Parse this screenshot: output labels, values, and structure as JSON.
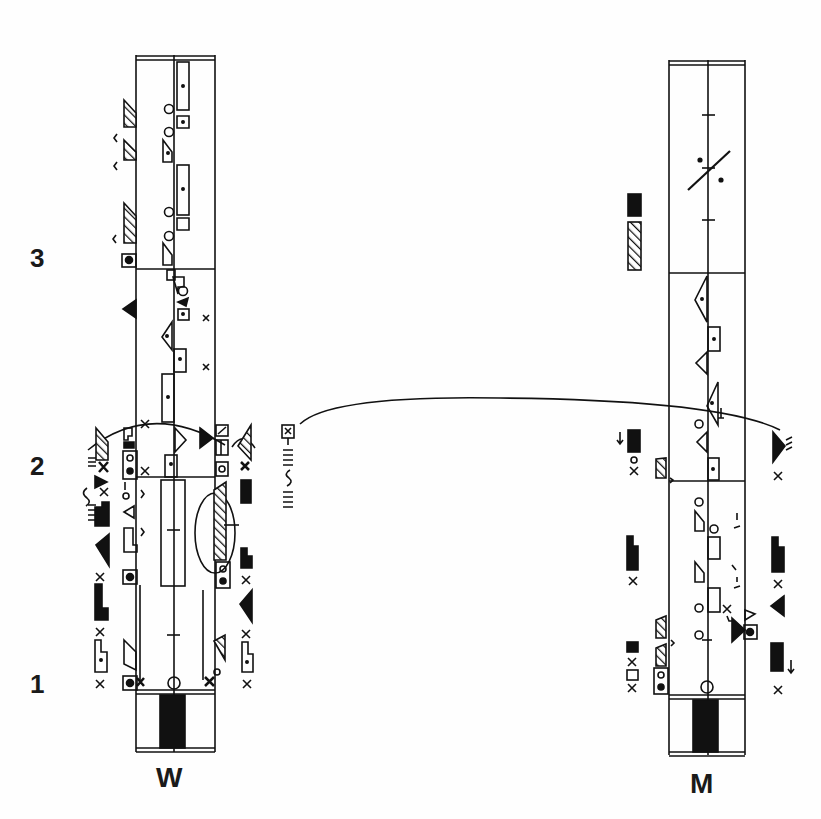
{
  "score": {
    "type": "labanotation",
    "measure_numbers": [
      {
        "label": "3",
        "y": 258
      },
      {
        "label": "2",
        "y": 466
      },
      {
        "label": "1",
        "y": 684
      }
    ],
    "staves": [
      {
        "id": "woman",
        "label": "W",
        "x_left": 135,
        "x_right": 215,
        "x_center": 174
      },
      {
        "id": "man",
        "label": "M",
        "x_left": 668,
        "x_right": 745,
        "x_center": 706
      }
    ],
    "colors": {
      "ink": "#111111",
      "paper": "#fefefe"
    }
  }
}
